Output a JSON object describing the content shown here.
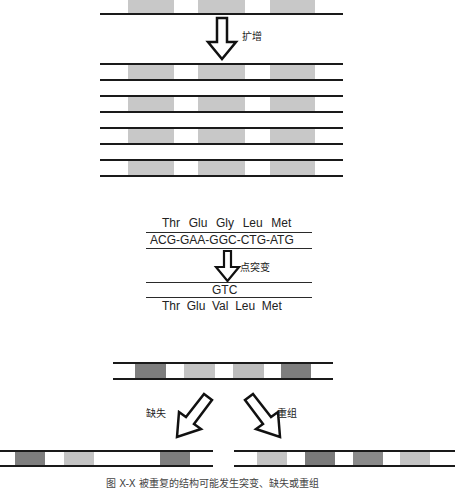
{
  "colors": {
    "line": "#1a1a1a",
    "band_light": "#cccccc",
    "band_mid": "#b3b3b3",
    "band_dark": "#808080",
    "band_darker": "#7a7a7a"
  },
  "amplification": {
    "label": "扩增",
    "original_strand": {
      "bands": [
        [
          128,
          173
        ],
        [
          198,
          245
        ],
        [
          270,
          315
        ]
      ]
    },
    "copies": 4
  },
  "point_mutation": {
    "amino_acids_before": "Thr  Glu  Gly  Leu  Met",
    "codons_before": "ACG-GAA-GGC-CTG-ATG",
    "label": "点突变",
    "mutated_codon": "GTC",
    "amino_acids_after": "Thr  Glu  Val  Leu  Met"
  },
  "rearrangement": {
    "original_strand_bands": [
      "dark",
      "light",
      "light",
      "dark"
    ],
    "deletion_label": "缺失",
    "recombination_label": "重组",
    "deletion_result_bands": [
      "dark",
      "light",
      "dark"
    ],
    "recombination_result_bands": [
      "light",
      "dark",
      "dark",
      "light"
    ]
  },
  "caption": "图 X-X  被重复的结构可能发生突变、缺失或重组"
}
